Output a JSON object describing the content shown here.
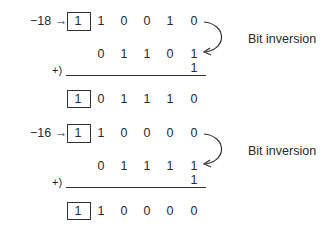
{
  "blocks": [
    {
      "value_label": "−18 →",
      "original_bits": [
        "1",
        "1",
        "0",
        "0",
        "1",
        "0"
      ],
      "inverted_bits": [
        "0",
        "1",
        "1",
        "0",
        "1"
      ],
      "add_one": "1",
      "plus_label": "+)",
      "result_bits": [
        "1",
        "0",
        "1",
        "1",
        "1",
        "0"
      ],
      "annotation": "Bit inversion"
    },
    {
      "value_label": "−16 →",
      "original_bits": [
        "1",
        "1",
        "0",
        "0",
        "0",
        "0"
      ],
      "inverted_bits": [
        "0",
        "1",
        "1",
        "1",
        "1"
      ],
      "add_one": "1",
      "plus_label": "+)",
      "result_bits": [
        "1",
        "1",
        "0",
        "0",
        "0",
        "0"
      ],
      "annotation": "Bit inversion"
    }
  ]
}
